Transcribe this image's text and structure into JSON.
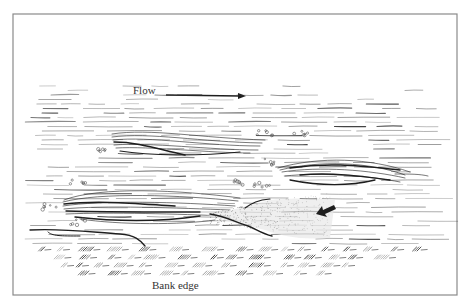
{
  "figure": {
    "width": 465,
    "height": 304,
    "frame": {
      "x": 13,
      "y": 14,
      "width": 444,
      "height": 281,
      "color": "#8a8a8a"
    },
    "background": "#ffffff",
    "ink_color": "#1e1e1e"
  },
  "labels": {
    "flow": {
      "text": "Flow",
      "x": 133,
      "y": 94
    },
    "bank_edge": {
      "text": "Bank edge",
      "x": 152,
      "y": 289
    }
  },
  "arrows": {
    "flow_arrow": {
      "x1": 166,
      "y1": 95,
      "x2": 246,
      "y2": 96,
      "direction": "right"
    },
    "small_arrow": {
      "x1": 334,
      "y1": 206,
      "x2": 316,
      "y2": 214,
      "direction": "left-down"
    }
  },
  "features": {
    "streak_bundles": [
      {
        "name": "upper-left-streak",
        "x0": 112,
        "x1": 265,
        "y_top": 132,
        "y_bot": 155
      },
      {
        "name": "right-streak",
        "x0": 275,
        "x1": 410,
        "y_top": 158,
        "y_bot": 185
      },
      {
        "name": "lower-left-streak",
        "x0": 62,
        "x1": 242,
        "y_top": 192,
        "y_bot": 222
      }
    ],
    "stippled_wake": {
      "x0": 205,
      "x1": 330,
      "y_top": 198,
      "y_bot": 240
    },
    "bubble_clusters": [
      {
        "cx": 100,
        "cy": 150
      },
      {
        "cx": 78,
        "cy": 181
      },
      {
        "cx": 50,
        "cy": 207
      },
      {
        "cx": 78,
        "cy": 222
      },
      {
        "cx": 265,
        "cy": 133
      },
      {
        "cx": 300,
        "cy": 134
      },
      {
        "cx": 270,
        "cy": 162
      },
      {
        "cx": 240,
        "cy": 182
      },
      {
        "cx": 262,
        "cy": 184
      }
    ],
    "bank_grass": {
      "y_top": 247,
      "y_bot": 280,
      "x0": 30,
      "x1": 420
    }
  }
}
